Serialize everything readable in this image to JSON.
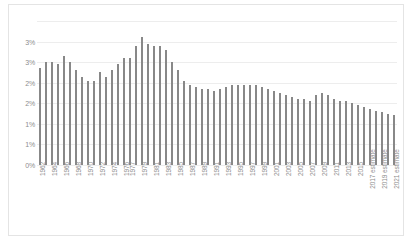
{
  "chart_data": {
    "type": "bar",
    "title": "",
    "subtitle": "",
    "xlabel": "",
    "ylabel": "",
    "ylim": [
      0,
      3.5
    ],
    "ytick_values": [
      0,
      0.5,
      1.0,
      1.5,
      2.0,
      2.5,
      3.0,
      3.5
    ],
    "ytick_labels": [
      "0%",
      "1%",
      "1%",
      "2%",
      "2%",
      "3%",
      "3%",
      ""
    ],
    "grid": true,
    "legend": null,
    "series_color": "#888888",
    "gridline_color": "#ededed",
    "tick_label_color": "#8d8d8d",
    "categories": [
      "1962",
      "1963",
      "1964",
      "1965",
      "1966",
      "1967",
      "1968",
      "1969",
      "1970",
      "1971",
      "1972",
      "1973",
      "1974",
      "1975",
      "1976",
      "1977",
      "1978",
      "1979",
      "1980",
      "1981",
      "1982",
      "1983",
      "1984",
      "1985",
      "1986",
      "1987",
      "1988",
      "1989",
      "1990",
      "1991",
      "1992",
      "1993",
      "1994",
      "1995",
      "1996",
      "1997",
      "1998",
      "1999",
      "2000",
      "2001",
      "2002",
      "2003",
      "2004",
      "2005",
      "2006",
      "2007",
      "2008",
      "2009",
      "2010",
      "2011",
      "2012",
      "2013",
      "2014",
      "2015",
      "2016",
      "2017 estimate",
      "2018 estimate",
      "2019 estimate",
      "2020 estimate",
      "2021 estimate"
    ],
    "tick_labels_shown": [
      "1962",
      "",
      "1964",
      "",
      "1966",
      "",
      "1968",
      "",
      "1970",
      "",
      "1972",
      "",
      "1974",
      "",
      "1976",
      "1977",
      "",
      "1979",
      "",
      "1981",
      "",
      "1983",
      "",
      "1985",
      "",
      "1987",
      "",
      "1989",
      "",
      "1991",
      "",
      "1993",
      "",
      "1995",
      "",
      "1997",
      "",
      "1999",
      "",
      "2001",
      "",
      "2003",
      "",
      "2005",
      "",
      "2007",
      "",
      "2009",
      "",
      "2011",
      "",
      "2013",
      "",
      "2015",
      "",
      "2017 estimate",
      "",
      "2019 estimate",
      "",
      "2021 estimate"
    ],
    "values": [
      2.35,
      2.5,
      2.5,
      2.45,
      2.65,
      2.5,
      2.3,
      2.15,
      2.05,
      2.05,
      2.25,
      2.15,
      2.3,
      2.45,
      2.6,
      2.6,
      2.9,
      3.1,
      2.95,
      2.9,
      2.9,
      2.8,
      2.5,
      2.3,
      2.05,
      1.95,
      1.9,
      1.85,
      1.85,
      1.8,
      1.85,
      1.9,
      1.95,
      1.95,
      1.95,
      1.95,
      1.95,
      1.9,
      1.85,
      1.8,
      1.75,
      1.7,
      1.65,
      1.6,
      1.6,
      1.55,
      1.7,
      1.75,
      1.7,
      1.6,
      1.55,
      1.55,
      1.5,
      1.45,
      1.4,
      1.35,
      1.32,
      1.28,
      1.25,
      1.22
    ]
  }
}
